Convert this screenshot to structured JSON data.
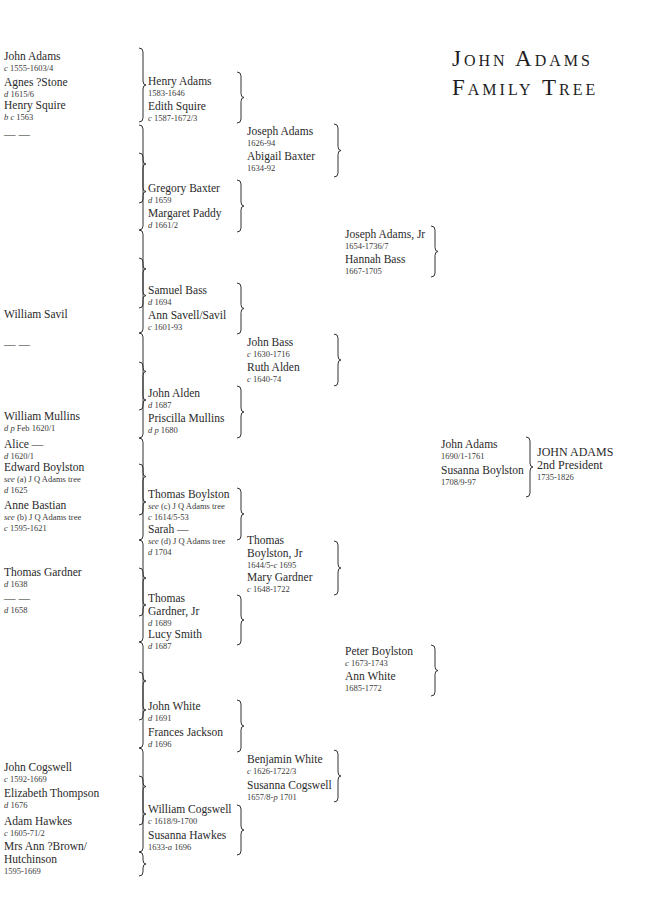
{
  "title": {
    "line1": "John Adams",
    "line2": "Family Tree"
  },
  "generations": {
    "gen5": [
      {
        "name": "John Adams",
        "dates": "c 1555-1603/4"
      },
      {
        "name": "Agnes ?Stone",
        "dates": "d 1615/6"
      },
      {
        "name": "Henry Squire",
        "dates": "b c 1563"
      },
      {
        "name": "— —",
        "dates": ""
      },
      {
        "name": "William Savil",
        "dates": ""
      },
      {
        "name": "— —",
        "dates": ""
      },
      {
        "name": "William Mullins",
        "dates": "d p Feb  1620/1"
      },
      {
        "name": "Alice —",
        "dates": "d 1620/1"
      },
      {
        "name": "Edward Boylston",
        "note": "see (a) J Q Adams tree",
        "dates": "d 1625"
      },
      {
        "name": "Anne Bastian",
        "note": "see (b) J Q Adams tree",
        "dates": "c 1595-1621"
      },
      {
        "name": "Thomas Gardner",
        "dates": "d 1638"
      },
      {
        "name": "— —",
        "dates": "d 1658"
      },
      {
        "name": "John Cogswell",
        "dates": "c 1592-1669"
      },
      {
        "name": "Elizabeth Thompson",
        "dates": "d 1676"
      },
      {
        "name": "Adam Hawkes",
        "dates": "c 1605-71/2"
      },
      {
        "name": "Mrs Ann ?Brown/ Hutchinson",
        "dates": "1595-1669"
      }
    ],
    "gen4": [
      {
        "name": "Henry Adams",
        "dates": "1583-1646"
      },
      {
        "name": "Edith Squire",
        "dates": "c 1587-1672/3"
      },
      {
        "name": "Gregory Baxter",
        "dates": "d 1659"
      },
      {
        "name": "Margaret Paddy",
        "dates": "d 1661/2"
      },
      {
        "name": "Samuel Bass",
        "dates": "d 1694"
      },
      {
        "name": "Ann Savell/Savil",
        "dates": "c 1601-93"
      },
      {
        "name": "John Alden",
        "dates": "d 1687"
      },
      {
        "name": "Priscilla Mullins",
        "dates": "d p 1680"
      },
      {
        "name": "Thomas Boylston",
        "note": "see (c) J Q Adams tree",
        "dates": "c 1614/5-53"
      },
      {
        "name": "Sarah —",
        "note": "see (d) J Q Adams tree",
        "dates": "d 1704"
      },
      {
        "name": "Thomas Gardner, Jr",
        "dates": "d 1689"
      },
      {
        "name": "Lucy Smith",
        "dates": "d 1687"
      },
      {
        "name": "John White",
        "dates": "d 1691"
      },
      {
        "name": "Frances Jackson",
        "dates": "d 1696"
      },
      {
        "name": "William Cogswell",
        "dates": "c 1618/9-1700"
      },
      {
        "name": "Susanna Hawkes",
        "dates": "1633-a 1696"
      }
    ],
    "gen3": [
      {
        "name": "Joseph Adams",
        "dates": "1626-94"
      },
      {
        "name": "Abigail Baxter",
        "dates": "1634-92"
      },
      {
        "name": "John Bass",
        "dates": "c 1630-1716"
      },
      {
        "name": "Ruth Alden",
        "dates": "c 1640-74"
      },
      {
        "name": "Thomas Boylston, Jr",
        "dates": "1644/5-c 1695"
      },
      {
        "name": "Mary Gardner",
        "dates": "c 1648-1722"
      },
      {
        "name": "Benjamin White",
        "dates": "c 1626-1722/3"
      },
      {
        "name": "Susanna Cogswell",
        "dates": "1657/8-p 1701"
      }
    ],
    "gen2": [
      {
        "name": "Joseph Adams, Jr",
        "dates": "1654-1736/7"
      },
      {
        "name": "Hannah Bass",
        "dates": "1667-1705"
      },
      {
        "name": "Peter Boylston",
        "dates": "c 1673-1743"
      },
      {
        "name": "Ann White",
        "dates": "1685-1772"
      }
    ],
    "gen1": [
      {
        "name": "John Adams",
        "dates": "1690/1-1761"
      },
      {
        "name": "Susanna Boylston",
        "dates": "1708/9-97"
      }
    ],
    "subject": {
      "name": "JOHN ADAMS",
      "role": "2nd President",
      "dates": "1735-1826"
    }
  }
}
